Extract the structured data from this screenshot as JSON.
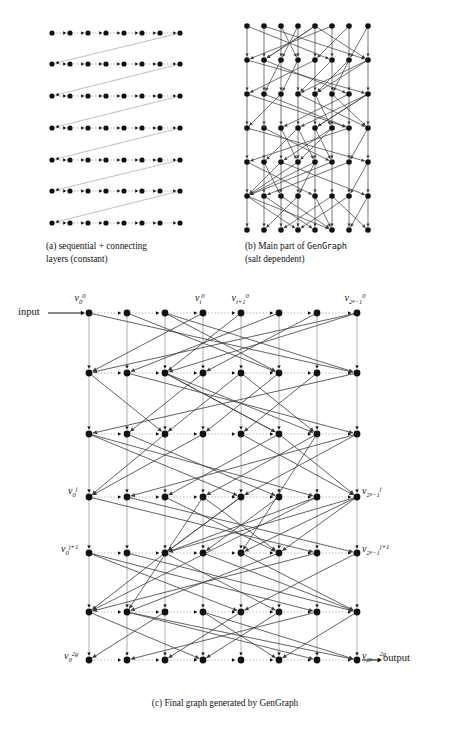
{
  "figure": {
    "panels": [
      {
        "id": "a",
        "caption_line1": "(a) sequential + connecting",
        "caption_line2": "layers (constant)",
        "graph": {
          "type": "layered-graph",
          "columns": 8,
          "rows": 7,
          "col_x": [
            52,
            70,
            88,
            106,
            124,
            142,
            160,
            180
          ],
          "row_y": [
            33,
            64,
            96,
            128,
            160,
            191,
            223
          ],
          "node_radius": 2.6,
          "description": "sequential chains per row with a connecting edge from last node of a row to first node of next row"
        }
      },
      {
        "id": "b",
        "caption_line1": "(b)  Main  part  of  GenGraph",
        "caption_line2": "(salt dependent)",
        "caption_mono_token": "GenGraph",
        "graph": {
          "type": "layered-graph",
          "columns": 8,
          "rows": 7,
          "col_x": [
            247,
            264,
            281,
            298,
            315,
            332,
            349,
            368
          ],
          "row_y": [
            26,
            60,
            94,
            128,
            162,
            196,
            230
          ],
          "node_radius": 2.8,
          "description": "salt dependent random bipartite crossing edges between consecutive rows plus vertical column edges"
        }
      },
      {
        "id": "c",
        "caption": "(c) Final graph generated by GenGraph",
        "caption_prefix": "(c) Final graph generated by ",
        "caption_mono_token": "GenGraph",
        "graph": {
          "type": "layered-graph",
          "columns": 8,
          "rows": 7,
          "col_x": [
            89,
            127,
            165,
            203,
            241,
            279,
            317,
            357
          ],
          "row_y": [
            313,
            373,
            434,
            497,
            553,
            612,
            660
          ],
          "node_radius": 3.4,
          "description": "final composed graph: sequential row edges, vertical column edges, and salt dependent crossing edges"
        }
      }
    ],
    "io": {
      "input_label": "input",
      "output_label": "output"
    },
    "vertex_labels": {
      "top": [
        {
          "base": "v",
          "sub": "0",
          "sup": "0",
          "x": 80,
          "y": 292,
          "anchor": "center"
        },
        {
          "base": "v",
          "sub": "i",
          "sup": "0",
          "x": 200,
          "y": 292,
          "anchor": "center"
        },
        {
          "base": "v",
          "sub": "i+1",
          "sup": "0",
          "x": 240,
          "y": 292,
          "anchor": "center"
        },
        {
          "base": "v",
          "sub": "2",
          "sub_sup": "g",
          "sub_tail": "−1",
          "sup": "0",
          "x": 355,
          "y": 292,
          "anchor": "center"
        }
      ],
      "left": [
        {
          "base": "v",
          "sub": "0",
          "sup": "j",
          "x": 78,
          "y": 485,
          "anchor": "right"
        },
        {
          "base": "v",
          "sub": "0",
          "sup": "j+1",
          "x": 78,
          "y": 543,
          "anchor": "right"
        },
        {
          "base": "v",
          "sub": "0",
          "sup": "2g",
          "x": 78,
          "y": 650,
          "anchor": "right"
        }
      ],
      "right": [
        {
          "base": "v",
          "sub": "2",
          "sub_sup": "g",
          "sub_tail": "−1",
          "sup": "j",
          "x": 362,
          "y": 485,
          "anchor": "left"
        },
        {
          "base": "v",
          "sub": "2",
          "sub_sup": "g",
          "sub_tail": "−1",
          "sup": "j+1",
          "x": 362,
          "y": 543,
          "anchor": "left"
        },
        {
          "base": "v",
          "sub": "2",
          "sub_sup": "g",
          "sub_tail": "−1",
          "sup": "2g",
          "x": 362,
          "y": 650,
          "anchor": "left"
        }
      ]
    },
    "style": {
      "node_color": "#111111",
      "edge_color": "#3a3a3a",
      "faint_edge_color": "#9a9a9a",
      "background": "#ffffff",
      "text_color": "#111111"
    }
  }
}
